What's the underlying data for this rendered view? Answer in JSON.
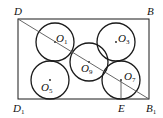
{
  "diagram": {
    "rectangle": {
      "x": 18,
      "y": 19,
      "width": 131,
      "height": 80
    },
    "diagonal": {
      "from": "D",
      "to": "B1"
    },
    "points": [
      {
        "name": "D",
        "label": "D",
        "sub": "",
        "x": 18,
        "y": 19,
        "lx": 14,
        "ly": 15
      },
      {
        "name": "B",
        "label": "B",
        "sub": "",
        "x": 149,
        "y": 19,
        "lx": 147,
        "ly": 15
      },
      {
        "name": "D1",
        "label": "D",
        "sub": "1",
        "x": 18,
        "y": 99,
        "lx": 13,
        "ly": 112
      },
      {
        "name": "B1",
        "label": "B",
        "sub": "1",
        "x": 149,
        "y": 99,
        "lx": 146,
        "ly": 112
      },
      {
        "name": "E",
        "label": "E",
        "sub": "",
        "x": 121,
        "y": 99,
        "lx": 118,
        "ly": 112
      }
    ],
    "circles": [
      {
        "name": "O1",
        "label": "O",
        "sub": "1",
        "cx": 55,
        "cy": 42,
        "r": 19,
        "lx": 56,
        "ly": 42
      },
      {
        "name": "O3",
        "label": "O",
        "sub": "3",
        "cx": 116,
        "cy": 42,
        "r": 19,
        "lx": 118,
        "ly": 42
      },
      {
        "name": "O9",
        "label": "O",
        "sub": "9",
        "cx": 89,
        "cy": 62,
        "r": 19,
        "lx": 81,
        "ly": 72
      },
      {
        "name": "O5",
        "label": "O",
        "sub": "5",
        "cx": 50,
        "cy": 80,
        "r": 19,
        "lx": 41,
        "ly": 91
      },
      {
        "name": "O7",
        "label": "O",
        "sub": "7",
        "cx": 121,
        "cy": 80,
        "r": 19,
        "lx": 124,
        "ly": 80
      }
    ],
    "segment_O7_E": {
      "x1": 121,
      "y1": 80,
      "x2": 121,
      "y2": 99
    },
    "stroke_color": "#1a1a1a",
    "light_stroke_color": "#555555"
  }
}
